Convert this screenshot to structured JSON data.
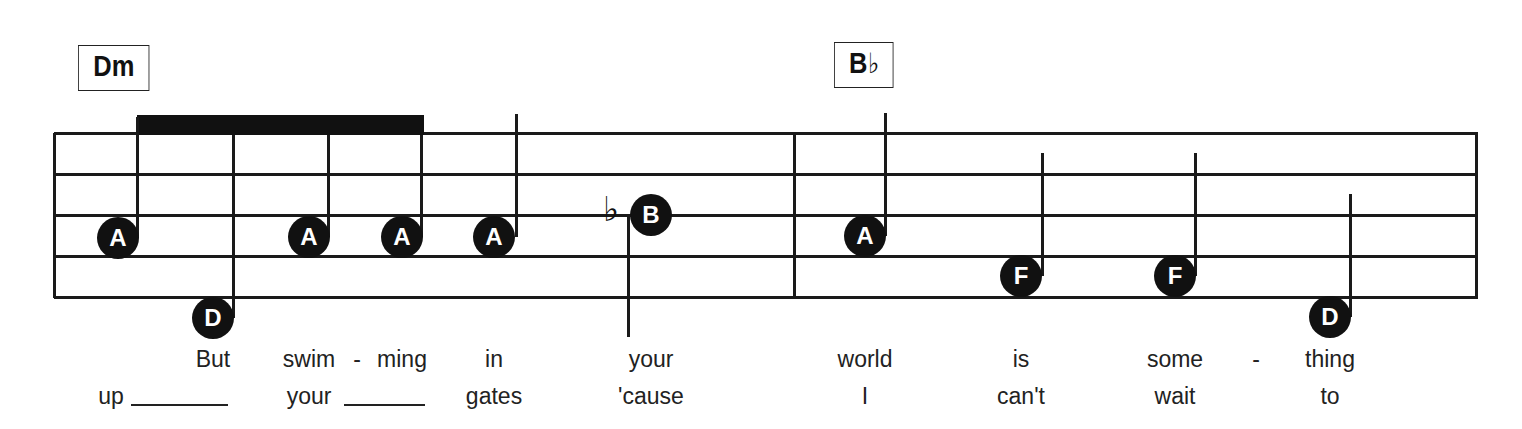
{
  "chords": [
    {
      "root": "Dm",
      "accidental": "",
      "x": 78,
      "y": 45,
      "w": 70
    },
    {
      "root": "B",
      "accidental": "♭",
      "x": 834,
      "y": 42,
      "w": 58
    }
  ],
  "staff": {
    "left": 54,
    "right": 1478,
    "lines_y": [
      133,
      174,
      215,
      256,
      297
    ],
    "barlines_x": [
      54,
      794,
      1476
    ]
  },
  "beam": {
    "x1": 137,
    "x2": 424,
    "y": 115,
    "h": 20
  },
  "notes": [
    {
      "name": "A",
      "cx": 118,
      "cy": 238,
      "stem_x": 137,
      "stem_top": 117,
      "stem_bottom": 238
    },
    {
      "name": "D",
      "cx": 213,
      "cy": 318,
      "stem_x": 233,
      "stem_top": 135,
      "stem_bottom": 318
    },
    {
      "name": "A",
      "cx": 309,
      "cy": 237,
      "stem_x": 328,
      "stem_top": 135,
      "stem_bottom": 237
    },
    {
      "name": "A",
      "cx": 402,
      "cy": 237,
      "stem_x": 421,
      "stem_top": 135,
      "stem_bottom": 237
    },
    {
      "name": "A",
      "cx": 494,
      "cy": 237,
      "stem_x": 516,
      "stem_top": 114,
      "stem_bottom": 237
    },
    {
      "name": "B",
      "cx": 651,
      "cy": 215,
      "accidental": "♭",
      "acc_x": 603,
      "acc_y": 192,
      "stem_x": 628,
      "stem_down": true,
      "stem_top": 215,
      "stem_bottom": 337
    },
    {
      "name": "A",
      "cx": 865,
      "cy": 236,
      "stem_x": 885,
      "stem_top": 113,
      "stem_bottom": 236
    },
    {
      "name": "F",
      "cx": 1021,
      "cy": 276,
      "stem_x": 1042,
      "stem_top": 153,
      "stem_bottom": 276
    },
    {
      "name": "F",
      "cx": 1175,
      "cy": 276,
      "stem_x": 1195,
      "stem_top": 153,
      "stem_bottom": 276
    },
    {
      "name": "D",
      "cx": 1330,
      "cy": 317,
      "stem_x": 1350,
      "stem_top": 194,
      "stem_bottom": 317
    }
  ],
  "lyrics": {
    "verse1": [
      {
        "text": "But",
        "x": 213
      },
      {
        "text": "swim",
        "x": 309
      },
      {
        "text": "-",
        "x": 357
      },
      {
        "text": "ming",
        "x": 402
      },
      {
        "text": "in",
        "x": 494
      },
      {
        "text": "your",
        "x": 651
      },
      {
        "text": "world",
        "x": 865
      },
      {
        "text": "is",
        "x": 1021
      },
      {
        "text": "some",
        "x": 1175
      },
      {
        "text": "-",
        "x": 1256
      },
      {
        "text": "thing",
        "x": 1330
      }
    ],
    "verse2": [
      {
        "text": "up",
        "x": 111
      },
      {
        "text": "your",
        "x": 309
      },
      {
        "text": "gates",
        "x": 494
      },
      {
        "text": "'cause",
        "x": 651
      },
      {
        "text": "I",
        "x": 865
      },
      {
        "text": "can't",
        "x": 1021
      },
      {
        "text": "wait",
        "x": 1175
      },
      {
        "text": "to",
        "x": 1330
      }
    ],
    "verse1_y": 346,
    "verse2_y": 383,
    "extenders": [
      {
        "x": 131,
        "w": 97,
        "y": 404
      },
      {
        "x": 344,
        "w": 81,
        "y": 404
      }
    ]
  }
}
